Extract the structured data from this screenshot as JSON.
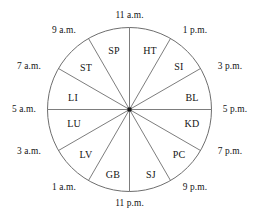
{
  "figure": {
    "name": "organ-clock",
    "geometry": {
      "center_x": 129.5,
      "center_y": 109.5,
      "radius": 82,
      "hub_size": 4,
      "sector_count": 12
    },
    "colors": {
      "background": "#ffffff",
      "stroke": "#6e6e6e",
      "text": "#141414",
      "hub": "#1a1a1a"
    }
  },
  "chart_data": {
    "type": "pie",
    "title": "",
    "xlabel": "",
    "ylabel": "",
    "legend": "none",
    "grid": false,
    "categories": [
      "HT",
      "SI",
      "BL",
      "KD",
      "PC",
      "SJ",
      "GB",
      "LV",
      "LU",
      "LI",
      "ST",
      "SP"
    ],
    "values": [
      1,
      1,
      1,
      1,
      1,
      1,
      1,
      1,
      1,
      1,
      1,
      1
    ],
    "spoke_labels": [
      "11 a.m.",
      "1 p.m.",
      "3 p.m.",
      "5 p.m.",
      "7 p.m.",
      "9 p.m.",
      "11 p.m.",
      "1 a.m.",
      "3 a.m.",
      "5 a.m.",
      "7 a.m.",
      "9 a.m."
    ]
  },
  "spokes": [
    {
      "id": "spoke-11am",
      "label": "11 a.m.",
      "angle_deg": 0,
      "lx": 129.5,
      "ly": 16,
      "align": "center"
    },
    {
      "id": "spoke-1pm",
      "label": "1 p.m.",
      "angle_deg": 30,
      "lx": 195,
      "ly": 31,
      "align": "center"
    },
    {
      "id": "spoke-3pm",
      "label": "3 p.m.",
      "angle_deg": 60,
      "lx": 230,
      "ly": 67,
      "align": "center"
    },
    {
      "id": "spoke-5pm",
      "label": "5 p.m.",
      "angle_deg": 90,
      "lx": 235,
      "ly": 110,
      "align": "center"
    },
    {
      "id": "spoke-7pm",
      "label": "7 p.m.",
      "angle_deg": 120,
      "lx": 230,
      "ly": 152,
      "align": "center"
    },
    {
      "id": "spoke-9pm",
      "label": "9 p.m.",
      "angle_deg": 150,
      "lx": 195,
      "ly": 188,
      "align": "center"
    },
    {
      "id": "spoke-11pm",
      "label": "11 p.m.",
      "angle_deg": 180,
      "lx": 129.5,
      "ly": 204,
      "align": "center"
    },
    {
      "id": "spoke-1am",
      "label": "1 a.m.",
      "angle_deg": 210,
      "lx": 64,
      "ly": 188,
      "align": "center"
    },
    {
      "id": "spoke-3am",
      "label": "3 a.m.",
      "angle_deg": 240,
      "lx": 29,
      "ly": 152,
      "align": "center"
    },
    {
      "id": "spoke-5am",
      "label": "5 a.m.",
      "angle_deg": 270,
      "lx": 24,
      "ly": 110,
      "align": "center"
    },
    {
      "id": "spoke-7am",
      "label": "7 a.m.",
      "angle_deg": 300,
      "lx": 29,
      "ly": 67,
      "align": "center"
    },
    {
      "id": "spoke-9am",
      "label": "9 a.m.",
      "angle_deg": 330,
      "lx": 64,
      "ly": 31,
      "align": "center"
    }
  ],
  "sectors": [
    {
      "id": "sector-ht",
      "label": "HT",
      "mid_angle_deg": 15,
      "lx": 150,
      "ly": 51
    },
    {
      "id": "sector-si",
      "label": "SI",
      "mid_angle_deg": 45,
      "lx": 179,
      "ly": 67
    },
    {
      "id": "sector-bl",
      "label": "BL",
      "mid_angle_deg": 75,
      "lx": 192,
      "ly": 98
    },
    {
      "id": "sector-kd",
      "label": "KD",
      "mid_angle_deg": 105,
      "lx": 192,
      "ly": 124
    },
    {
      "id": "sector-pc",
      "label": "PC",
      "mid_angle_deg": 135,
      "lx": 179,
      "ly": 155
    },
    {
      "id": "sector-sj",
      "label": "SJ",
      "mid_angle_deg": 165,
      "lx": 151,
      "ly": 175
    },
    {
      "id": "sector-gb",
      "label": "GB",
      "mid_angle_deg": 195,
      "lx": 113,
      "ly": 175
    },
    {
      "id": "sector-lv",
      "label": "LV",
      "mid_angle_deg": 225,
      "lx": 86,
      "ly": 155
    },
    {
      "id": "sector-lu",
      "label": "LU",
      "mid_angle_deg": 255,
      "lx": 74,
      "ly": 124
    },
    {
      "id": "sector-li",
      "label": "LI",
      "mid_angle_deg": 285,
      "lx": 73,
      "ly": 98
    },
    {
      "id": "sector-st",
      "label": "ST",
      "mid_angle_deg": 315,
      "lx": 86,
      "ly": 68
    },
    {
      "id": "sector-sp",
      "label": "SP",
      "mid_angle_deg": 345,
      "lx": 114,
      "ly": 51
    }
  ]
}
